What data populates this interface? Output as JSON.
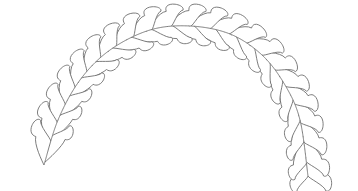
{
  "image": {
    "description": "Feathered arch line-art quilting pattern",
    "width": 358,
    "height": 191,
    "background": "#ffffff",
    "line_color": "#6e6e6e"
  },
  "spine": {
    "points": [
      [
        44,
        165
      ],
      [
        58,
        120
      ],
      [
        80,
        80
      ],
      [
        110,
        50
      ],
      [
        150,
        30
      ],
      [
        190,
        26
      ],
      [
        230,
        34
      ],
      [
        262,
        55
      ],
      [
        285,
        85
      ],
      [
        300,
        120
      ],
      [
        308,
        176
      ]
    ]
  },
  "outer_lobes_count": 22,
  "inner_lobes_count": 20
}
